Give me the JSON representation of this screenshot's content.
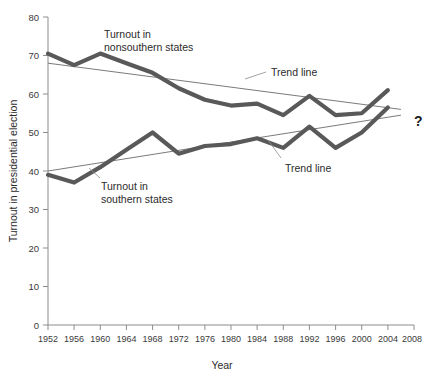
{
  "chart_data": {
    "type": "line",
    "title": "",
    "xlabel": "Year",
    "ylabel": "Turnout in presidential election",
    "xlim": [
      1952,
      2008
    ],
    "ylim": [
      0,
      80
    ],
    "grid": false,
    "legend_position": "inline-annotations",
    "x": [
      1952,
      1956,
      1960,
      1964,
      1968,
      1972,
      1976,
      1980,
      1984,
      1988,
      1992,
      1996,
      2000,
      2004
    ],
    "xticks": [
      "1952",
      "1956",
      "1960",
      "1964",
      "1968",
      "1972",
      "1976",
      "1980",
      "1984",
      "1988",
      "1992",
      "1996",
      "2000",
      "2004",
      "2008"
    ],
    "yticks": [
      "0",
      "10",
      "20",
      "30",
      "40",
      "50",
      "60",
      "70",
      "80"
    ],
    "series": [
      {
        "name": "Turnout in nonsouthern states",
        "color": "#595959",
        "values": [
          70.5,
          67.5,
          70.5,
          68.0,
          65.5,
          61.5,
          58.5,
          57.0,
          57.5,
          54.5,
          59.5,
          54.5,
          55.0,
          61.0
        ]
      },
      {
        "name": "Turnout in southern states",
        "color": "#595959",
        "values": [
          39.0,
          37.0,
          41.0,
          45.5,
          50.0,
          44.5,
          46.5,
          47.0,
          48.5,
          46.0,
          51.5,
          46.0,
          50.0,
          56.5
        ]
      }
    ],
    "trend_lines": [
      {
        "name": "Trend line nonsouthern",
        "color": "#6b6b6b",
        "x": [
          1952,
          2006
        ],
        "y": [
          68.0,
          56.0
        ]
      },
      {
        "name": "Trend line southern",
        "color": "#6b6b6b",
        "x": [
          1952,
          2006
        ],
        "y": [
          40.0,
          54.5
        ]
      }
    ],
    "annotations": [
      {
        "id": "label-nonsouthern-line1",
        "text": "Turnout in"
      },
      {
        "id": "label-nonsouthern-line2",
        "text": "nonsouthern states"
      },
      {
        "id": "label-southern-line1",
        "text": "Turnout in"
      },
      {
        "id": "label-southern-line2",
        "text": "southern states"
      },
      {
        "id": "label-trend-upper",
        "text": "Trend line"
      },
      {
        "id": "label-trend-lower",
        "text": "Trend line"
      },
      {
        "id": "label-question",
        "text": "?"
      }
    ]
  }
}
